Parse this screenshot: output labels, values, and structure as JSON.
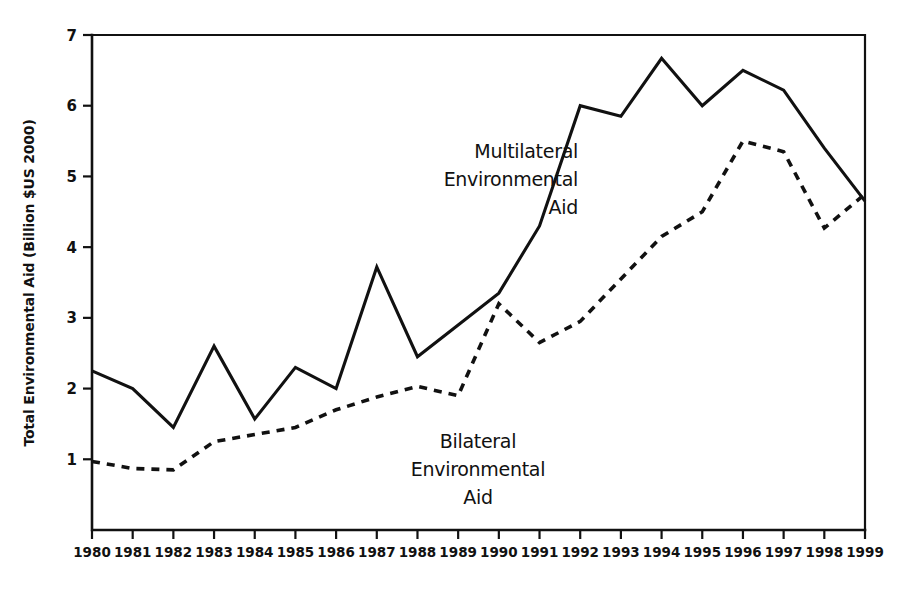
{
  "chart_data": {
    "type": "line",
    "title": "",
    "xlabel": "",
    "ylabel": "Total Environmental Aid (Billion $US 2000)",
    "categories": [
      "1980",
      "1981",
      "1982",
      "1983",
      "1984",
      "1985",
      "1986",
      "1987",
      "1988",
      "1989",
      "1990",
      "1991",
      "1992",
      "1993",
      "1994",
      "1995",
      "1996",
      "1997",
      "1998",
      "1999"
    ],
    "x": [
      1980,
      1981,
      1982,
      1983,
      1984,
      1985,
      1986,
      1987,
      1988,
      1989,
      1990,
      1991,
      1992,
      1993,
      1994,
      1995,
      1996,
      1997,
      1998,
      1999
    ],
    "xlim": [
      1980,
      1999
    ],
    "ylim": [
      0,
      7
    ],
    "y_ticks": [
      1,
      2,
      3,
      4,
      5,
      6,
      7
    ],
    "x_ticks": [
      "1980",
      "1981",
      "1982",
      "1983",
      "1984",
      "1985",
      "1986",
      "1987",
      "1988",
      "1989",
      "1990",
      "1991",
      "1992",
      "1993",
      "1994",
      "1995",
      "1996",
      "1997",
      "1998",
      "1999"
    ],
    "grid": false,
    "legend_position": "inline-annotations",
    "series": [
      {
        "name": "Multilateral Environmental Aid",
        "style": "solid",
        "values": [
          2.25,
          2.0,
          1.45,
          2.6,
          1.57,
          2.3,
          2.0,
          3.72,
          2.45,
          2.9,
          3.35,
          4.3,
          6.0,
          5.85,
          6.67,
          6.0,
          6.5,
          6.22,
          5.4,
          4.65
        ]
      },
      {
        "name": "Bilateral Environmental Aid",
        "style": "dashed",
        "values": [
          0.97,
          0.87,
          0.85,
          1.25,
          1.35,
          1.45,
          1.7,
          1.88,
          2.03,
          1.9,
          3.2,
          2.65,
          2.95,
          3.55,
          4.15,
          4.5,
          5.5,
          5.35,
          4.27,
          4.75
        ]
      }
    ],
    "annotations": [
      {
        "name": "multilateral-label",
        "lines": [
          "Multilateral",
          "Environmental",
          "Aid"
        ],
        "align": "right"
      },
      {
        "name": "bilateral-label",
        "lines": [
          "Bilateral",
          "Environmental",
          "Aid"
        ],
        "align": "center"
      }
    ]
  },
  "colors": {
    "ink": "#111111",
    "background": "#ffffff"
  }
}
